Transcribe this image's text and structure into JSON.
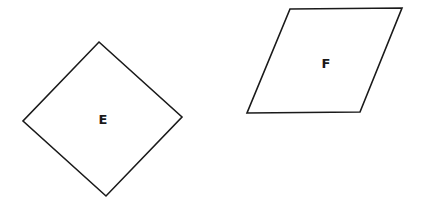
{
  "diagram": {
    "shapes": [
      {
        "id": "E",
        "label": "E",
        "kind": "rhombus-rotated-square",
        "points": "99,42 182,117 106,196 23,121",
        "label_pos": {
          "x": 103,
          "y": 124
        }
      },
      {
        "id": "F",
        "label": "F",
        "kind": "parallelogram",
        "points": "290,9 402,8 360,112 247,113",
        "label_pos": {
          "x": 326,
          "y": 68
        }
      }
    ],
    "stroke_color": "#1a1a1a",
    "background": "#ffffff"
  }
}
